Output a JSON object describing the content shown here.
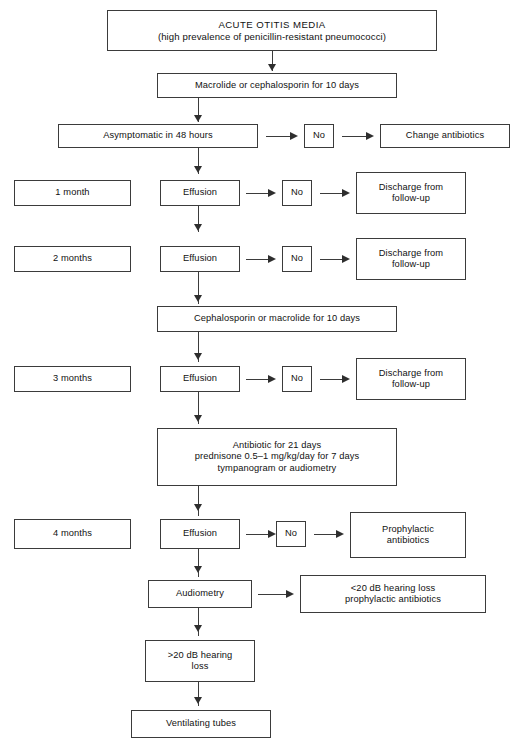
{
  "diagram": {
    "nodes": {
      "acute_otitis_media": {
        "line1": "ACUTE OTITIS MEDIA",
        "line2": "(high prevalence of penicillin-resistant pneumococci)"
      },
      "macrolide_or_cephalosporin": "Macrolide or cephalosporin for 10 days",
      "asymptomatic_48h": "Asymptomatic in 48 hours",
      "no_1": "No",
      "change_antibiotics": "Change antibiotics",
      "month_1": "1 month",
      "effusion_1": "Effusion",
      "no_2": "No",
      "discharge_1": "Discharge from\nfollow-up",
      "month_2": "2 months",
      "effusion_2": "Effusion",
      "no_3": "No",
      "discharge_2": "Discharge from\nfollow-up",
      "cephalosporin_or_macrolide": "Cephalosporin or macrolide for 10 days",
      "month_3": "3 months",
      "effusion_3": "Effusion",
      "no_4": "No",
      "discharge_3": "Discharge from\nfollow-up",
      "antibiotic_21_days": "Antibiotic for 21 days\nprednisone 0.5–1 mg/kg/day for 7 days\ntympanogram or audiometry",
      "month_4": "4 months",
      "effusion_4": "Effusion",
      "no_5": "No",
      "prophylactic_antibiotics": "Prophylactic\nantibiotics",
      "audiometry": "Audiometry",
      "hearing_loss_under_20": "<20 dB hearing loss\nprophylactic antibiotics",
      "hearing_loss_over_20": ">20 dB hearing\nloss",
      "ventilating_tubes": "Ventilating tubes"
    },
    "colors": {
      "border": "#3b3b3b",
      "arrow": "#2e2e2e",
      "background": "#ffffff",
      "text": "#111111"
    }
  }
}
